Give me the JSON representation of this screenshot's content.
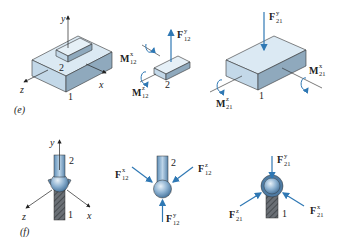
{
  "figure": {
    "panel_e": {
      "label": "(e)",
      "left": {
        "axes": {
          "y": "y",
          "x": "x",
          "z": "z"
        },
        "body_labels": {
          "upper": "2",
          "lower": "1"
        }
      },
      "middle": {
        "body_label": "2",
        "force_y": {
          "main": "F",
          "sup": "y",
          "sub": "12"
        },
        "moment_x": {
          "main": "M",
          "sup": "x",
          "sub": "12"
        },
        "moment_z": {
          "main": "M",
          "sup": "z",
          "sub": "12"
        }
      },
      "right": {
        "body_label": "1",
        "force_y": {
          "main": "F",
          "sup": "y",
          "sub": "21"
        },
        "moment_x": {
          "main": "M",
          "sup": "x",
          "sub": "21"
        },
        "moment_z": {
          "main": "M",
          "sup": "z",
          "sub": "21"
        }
      }
    },
    "panel_f": {
      "label": "(f)",
      "left": {
        "axes": {
          "y": "y",
          "x": "x",
          "z": "z"
        },
        "body_labels": {
          "upper": "2",
          "lower": "1"
        }
      },
      "middle": {
        "body_label": "2",
        "force_x": {
          "main": "F",
          "sup": "x",
          "sub": "12"
        },
        "force_z": {
          "main": "F",
          "sup": "z",
          "sub": "12"
        },
        "force_y": {
          "main": "F",
          "sup": "y",
          "sub": "12"
        }
      },
      "right": {
        "body_label": "1",
        "force_y": {
          "main": "F",
          "sup": "y",
          "sub": "21"
        },
        "force_z": {
          "main": "F",
          "sup": "z",
          "sub": "21"
        },
        "force_x": {
          "main": "F",
          "sup": "x",
          "sub": "21"
        }
      }
    },
    "colors": {
      "arrow_blue": "#2f78b4",
      "box_top": "#dbe9f3",
      "box_front": "#c3d8e8",
      "box_side": "#8fa9bd",
      "ball": "#7ea6c8",
      "hatch": "#555a60"
    }
  }
}
